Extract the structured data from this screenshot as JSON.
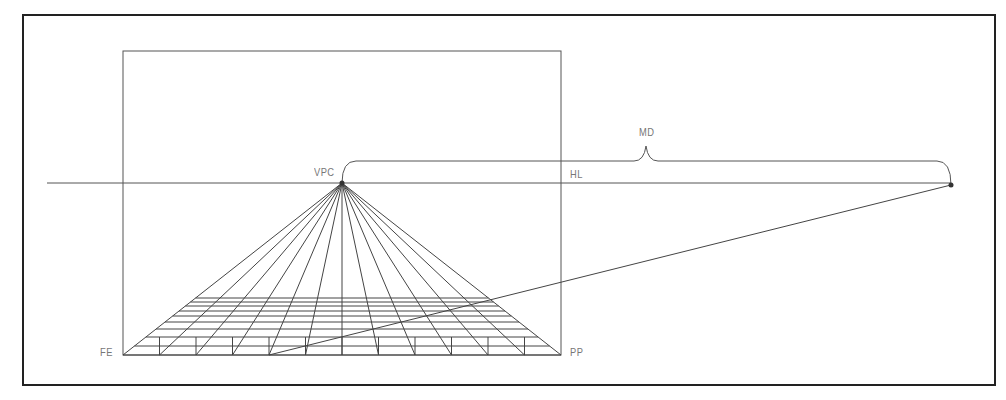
{
  "diagram": {
    "labels": {
      "vanishing_point": "VPC",
      "horizon_line": "HL",
      "measuring_distance": "MD",
      "floor_edge": "FE",
      "picture_plane": "PP"
    },
    "colors": {
      "line": "#4a4a4a",
      "frame": "#222222",
      "label": "#777777",
      "background": "#ffffff"
    },
    "geometry": {
      "frame": {
        "x": 23,
        "y": 15,
        "w": 972,
        "h": 370
      },
      "picture_plane": {
        "x": 123,
        "y": 51,
        "w": 438,
        "h": 304
      },
      "horizon_y": 183,
      "horizon_x_start": 47,
      "horizon_x_end": 951,
      "vpc": {
        "x": 342,
        "y": 183
      },
      "measuring_point": {
        "x": 951,
        "y": 185
      },
      "base_divisions": 12,
      "diagonal_start_index": 4,
      "floor_row_ys": [
        355,
        346,
        337,
        329,
        322,
        316,
        311,
        306,
        302,
        298
      ],
      "tick_top_y": 337,
      "brace_y": 161,
      "brace_peak": {
        "x": 646,
        "y": 146
      }
    }
  }
}
